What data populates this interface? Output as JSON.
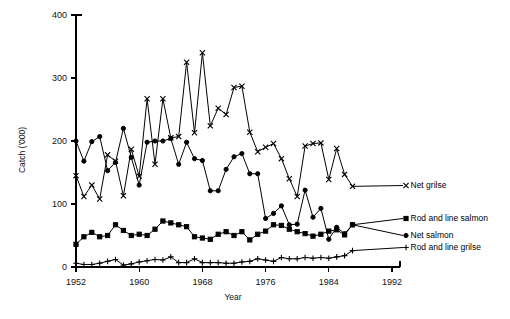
{
  "chart_data": {
    "type": "line",
    "title": "",
    "xlabel": "Year",
    "ylabel": "Catch ('000)",
    "xlim": [
      1952,
      1992
    ],
    "ylim": [
      0,
      400
    ],
    "xticks": [
      1952,
      1960,
      1968,
      1976,
      1984,
      1992
    ],
    "yticks": [
      0,
      100,
      200,
      300,
      400
    ],
    "grid": false,
    "legend_position": "right-inline",
    "x": [
      1952,
      1953,
      1954,
      1955,
      1956,
      1957,
      1958,
      1959,
      1960,
      1961,
      1962,
      1963,
      1964,
      1965,
      1966,
      1967,
      1968,
      1969,
      1970,
      1971,
      1972,
      1973,
      1974,
      1975,
      1976,
      1977,
      1978,
      1979,
      1980,
      1981,
      1982,
      1983,
      1984,
      1985,
      1986,
      1987
    ],
    "series": [
      {
        "name": "Net grilse",
        "marker": "x",
        "values": [
          145,
          112,
          130,
          108,
          178,
          168,
          113,
          187,
          144,
          267,
          163,
          267,
          205,
          207,
          325,
          213,
          340,
          224,
          252,
          242,
          285,
          287,
          214,
          183,
          190,
          196,
          172,
          140,
          112,
          192,
          196,
          197,
          139,
          188,
          147,
          128
        ]
      },
      {
        "name": "Net salmon",
        "marker": "circle",
        "values": [
          200,
          168,
          199,
          207,
          153,
          166,
          220,
          174,
          130,
          198,
          200,
          200,
          204,
          163,
          198,
          172,
          169,
          121,
          121,
          155,
          175,
          180,
          148,
          148,
          77,
          85,
          97,
          67,
          68,
          122,
          79,
          93,
          44,
          63,
          53,
          67
        ]
      },
      {
        "name": "Rod and line salmon",
        "marker": "square",
        "values": [
          36,
          48,
          55,
          48,
          50,
          67,
          58,
          50,
          52,
          50,
          60,
          73,
          70,
          67,
          64,
          48,
          46,
          44,
          52,
          56,
          50,
          56,
          43,
          52,
          57,
          67,
          66,
          60,
          56,
          53,
          49,
          52,
          57,
          59,
          51,
          67
        ]
      },
      {
        "name": "Rod and line grilse",
        "marker": "plus",
        "values": [
          6,
          4,
          4,
          6,
          9,
          12,
          3,
          5,
          8,
          10,
          12,
          11,
          16,
          7,
          7,
          13,
          7,
          7,
          7,
          6,
          6,
          8,
          9,
          13,
          11,
          9,
          15,
          13,
          13,
          15,
          14,
          15,
          14,
          16,
          18,
          26
        ]
      }
    ]
  },
  "legend": {
    "entries": [
      {
        "label": "Net grilse",
        "marker": "x"
      },
      {
        "label": "Rod and line salmon",
        "marker": "square"
      },
      {
        "label": "Net salmon",
        "marker": "circle"
      },
      {
        "label": "Rod and line grilse",
        "marker": "plus"
      }
    ]
  },
  "axes": {
    "y_title": "Catch ('000)",
    "x_title": "Year",
    "y_tick_labels": [
      "0",
      "100",
      "200",
      "300",
      "400"
    ],
    "x_tick_labels": [
      "1952",
      "1960",
      "1968",
      "1976",
      "1984",
      "1992"
    ]
  }
}
